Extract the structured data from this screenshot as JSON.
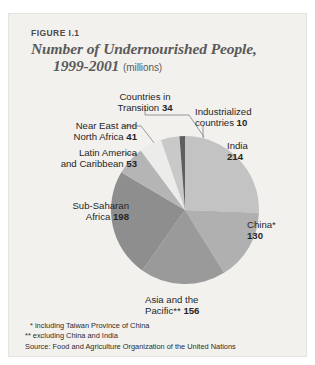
{
  "figure": {
    "label": "FIGURE I.1",
    "title_line1": "Number of Undernourished People,",
    "title_line2": "1999-2001",
    "units": "(millions)"
  },
  "footnotes": {
    "note1": "* including Taiwan Province of China",
    "note2": "** excluding China and India",
    "source": "Source: Food and Agriculture Organization of the United Nations"
  },
  "labels": {
    "india": {
      "name": "India",
      "value": "214"
    },
    "china": {
      "name": "China*",
      "value": "130"
    },
    "asia": {
      "name": "Asia and the",
      "name2": "Pacific**",
      "value": "156"
    },
    "subsaharan": {
      "name": "Sub-Saharan",
      "name2": "Africa",
      "value": "198"
    },
    "latin": {
      "name": "Latin America",
      "name2": "and Caribbean",
      "value": "53"
    },
    "neareast": {
      "name": "Near East and",
      "name2": "North Africa",
      "value": "41"
    },
    "transition": {
      "name": "Countries in",
      "name2": "Transition",
      "value": "34"
    },
    "industrialized": {
      "name": "Industrialized",
      "name2": "countries",
      "value": "10"
    }
  },
  "colors": {
    "panel": "#f2f1ee",
    "title": "#5b5b5b",
    "text": "#262626",
    "leader": "#8c8c8c",
    "india": "#c3c3c3",
    "china": "#b0b0b0",
    "asia": "#9a9a9a",
    "subsaharan": "#8e8e8e",
    "latin": "#b5b5b5",
    "neareast": "#ececea",
    "transition": "#c9c9c9",
    "industrialized": "#5e5e5e"
  },
  "chart_data": {
    "type": "pie",
    "title": "Number of Undernourished People, 1999-2001 (millions)",
    "unit": "millions",
    "legend": "labels-with-leader-lines",
    "total": 836,
    "categories": [
      "India",
      "China*",
      "Asia and the Pacific**",
      "Sub-Saharan Africa",
      "Latin America and Caribbean",
      "Near East and North Africa",
      "Countries in Transition",
      "Industrialized countries"
    ],
    "values": [
      214,
      130,
      156,
      198,
      53,
      41,
      34,
      10
    ],
    "colors": [
      "#c3c3c3",
      "#b0b0b0",
      "#9a9a9a",
      "#8e8e8e",
      "#b5b5b5",
      "#ececea",
      "#c9c9c9",
      "#5e5e5e"
    ],
    "start_angle_deg": 0,
    "direction": "clockwise",
    "annotations": [
      "* including Taiwan Province of China",
      "** excluding China and India"
    ],
    "source": "Food and Agriculture Organization of the United Nations"
  }
}
